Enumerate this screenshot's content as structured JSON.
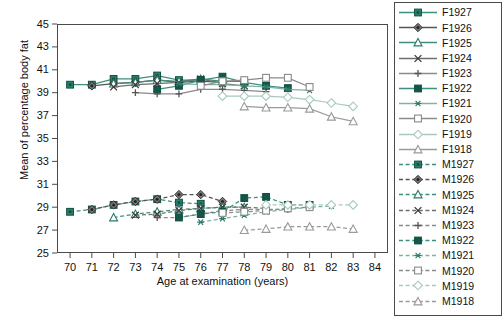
{
  "chart_data": {
    "type": "line",
    "title": "",
    "xlabel": "Age at examination (years)",
    "ylabel": "Mean of percentage body fat",
    "xlim": [
      69.4,
      84.6
    ],
    "ylim": [
      25,
      45
    ],
    "xticks": [
      70,
      71,
      72,
      73,
      74,
      75,
      76,
      77,
      78,
      79,
      80,
      81,
      82,
      83,
      84
    ],
    "yticks": [
      25,
      27,
      29,
      31,
      33,
      35,
      37,
      39,
      41,
      43,
      45
    ],
    "grid": false,
    "legend_position": "right-outside",
    "accent_color": "#2E7D6B",
    "grey_color": "#8a8a8a",
    "frame_color": "#4a4a4a",
    "series": [
      {
        "name": "F1927",
        "sex": "F",
        "cohort": 1927,
        "color": "#2E7D6B",
        "marker": "square-filled-teal",
        "dash": "solid",
        "x": [
          70,
          71,
          72,
          73,
          74,
          75,
          76
        ],
        "y": [
          39.7,
          39.7,
          40.2,
          40.2,
          40.5,
          40.1,
          40.1
        ]
      },
      {
        "name": "F1926",
        "sex": "F",
        "cohort": 1926,
        "color": "#555555",
        "marker": "diamond-filled",
        "dash": "solid",
        "x": [
          71,
          72,
          73,
          74,
          75,
          76,
          77
        ],
        "y": [
          39.6,
          39.8,
          39.9,
          40.1,
          39.9,
          40.0,
          39.9
        ]
      },
      {
        "name": "F1925",
        "sex": "F",
        "cohort": 1925,
        "color": "#2E7D6B",
        "marker": "triangle-open-teal",
        "dash": "solid",
        "x": [
          72,
          73,
          74,
          75,
          76,
          77,
          78
        ],
        "y": [
          39.8,
          39.9,
          40.1,
          40.0,
          40.2,
          40.0,
          40.0
        ]
      },
      {
        "name": "F1924",
        "sex": "F",
        "cohort": 1924,
        "color": "#6f6f6f",
        "marker": "x",
        "dash": "solid",
        "x": [
          72,
          73,
          74,
          75,
          76,
          77,
          78
        ],
        "y": [
          39.5,
          39.7,
          39.8,
          39.9,
          40.2,
          39.8,
          39.6
        ]
      },
      {
        "name": "F1923",
        "sex": "F",
        "cohort": 1923,
        "color": "#8a8a8a",
        "marker": "plus",
        "dash": "solid",
        "x": [
          73,
          74,
          75,
          76,
          77,
          78,
          79
        ],
        "y": [
          39.0,
          38.9,
          38.9,
          39.3,
          39.3,
          39.2,
          39.1
        ]
      },
      {
        "name": "F1922",
        "sex": "F",
        "cohort": 1922,
        "color": "#1f6b59",
        "marker": "square-solid-teal",
        "dash": "solid",
        "x": [
          74,
          75,
          76,
          77,
          78,
          79,
          80
        ],
        "y": [
          39.3,
          39.6,
          40.1,
          40.4,
          39.9,
          39.6,
          39.4
        ]
      },
      {
        "name": "F1921",
        "sex": "F",
        "cohort": 1921,
        "color": "#7fb3a5",
        "marker": "asterisk",
        "dash": "solid",
        "x": [
          75,
          76,
          77,
          78,
          79,
          80,
          81
        ],
        "y": [
          39.8,
          39.7,
          39.7,
          39.6,
          39.5,
          39.3,
          39.2
        ]
      },
      {
        "name": "F1920",
        "sex": "F",
        "cohort": 1920,
        "color": "#8a8a8a",
        "marker": "square-open",
        "dash": "solid",
        "x": [
          76,
          77,
          78,
          79,
          80,
          81
        ],
        "y": [
          39.6,
          40.0,
          40.1,
          40.3,
          40.3,
          39.5
        ]
      },
      {
        "name": "F1919",
        "sex": "F",
        "cohort": 1919,
        "color": "#a8c9c0",
        "marker": "diamond-open",
        "dash": "solid",
        "x": [
          77,
          78,
          79,
          80,
          81,
          82,
          83
        ],
        "y": [
          38.7,
          38.7,
          38.7,
          38.6,
          38.4,
          38.1,
          37.8
        ]
      },
      {
        "name": "F1918",
        "sex": "F",
        "cohort": 1918,
        "color": "#9a9a9a",
        "marker": "triangle-open",
        "dash": "solid",
        "x": [
          78,
          79,
          80,
          81,
          82,
          83
        ],
        "y": [
          37.8,
          37.7,
          37.7,
          37.6,
          36.9,
          36.5
        ]
      },
      {
        "name": "M1927",
        "sex": "M",
        "cohort": 1927,
        "color": "#2E7D6B",
        "marker": "square-filled-teal",
        "dash": "dashed",
        "x": [
          70,
          71,
          72,
          73,
          74,
          75,
          76
        ],
        "y": [
          28.6,
          28.8,
          29.2,
          29.5,
          29.7,
          29.4,
          29.3
        ]
      },
      {
        "name": "M1926",
        "sex": "M",
        "cohort": 1926,
        "color": "#555555",
        "marker": "diamond-filled",
        "dash": "dashed",
        "x": [
          71,
          72,
          73,
          74,
          75,
          76,
          77
        ],
        "y": [
          28.8,
          29.2,
          29.5,
          29.7,
          30.1,
          30.1,
          29.5
        ]
      },
      {
        "name": "M1925",
        "sex": "M",
        "cohort": 1925,
        "color": "#2E7D6B",
        "marker": "triangle-open-teal",
        "dash": "dashed",
        "x": [
          72,
          73,
          74,
          75,
          76,
          77,
          78
        ],
        "y": [
          28.1,
          28.4,
          28.6,
          28.8,
          28.9,
          29.0,
          29.0
        ]
      },
      {
        "name": "M1924",
        "sex": "M",
        "cohort": 1924,
        "color": "#6f6f6f",
        "marker": "x",
        "dash": "dashed",
        "x": [
          73,
          74,
          75,
          76,
          77,
          78,
          79
        ],
        "y": [
          28.3,
          28.4,
          28.7,
          28.9,
          29.0,
          29.0,
          28.9
        ]
      },
      {
        "name": "M1923",
        "sex": "M",
        "cohort": 1923,
        "color": "#8a8a8a",
        "marker": "plus",
        "dash": "dashed",
        "x": [
          74,
          75,
          76,
          77,
          78,
          79,
          80
        ],
        "y": [
          28.1,
          28.1,
          28.4,
          28.7,
          28.8,
          28.8,
          28.8
        ]
      },
      {
        "name": "M1922",
        "sex": "M",
        "cohort": 1922,
        "color": "#1f6b59",
        "marker": "square-solid-teal",
        "dash": "dashed",
        "x": [
          75,
          76,
          77,
          78,
          79,
          80,
          81
        ],
        "y": [
          28.1,
          28.4,
          28.6,
          29.8,
          29.9,
          29.2,
          29.2
        ]
      },
      {
        "name": "M1921",
        "sex": "M",
        "cohort": 1921,
        "color": "#7fb3a5",
        "marker": "asterisk",
        "dash": "dashed",
        "x": [
          76,
          77,
          78,
          79,
          80,
          81,
          82
        ],
        "y": [
          27.7,
          28.0,
          28.3,
          28.6,
          28.8,
          29.0,
          29.1
        ]
      },
      {
        "name": "M1920",
        "sex": "M",
        "cohort": 1920,
        "color": "#8a8a8a",
        "marker": "square-open",
        "dash": "dashed",
        "x": [
          77,
          78,
          79,
          80,
          81
        ],
        "y": [
          28.5,
          28.6,
          28.7,
          28.9,
          29.0
        ]
      },
      {
        "name": "M1919",
        "sex": "M",
        "cohort": 1919,
        "color": "#a8c9c0",
        "marker": "diamond-open",
        "dash": "dashed",
        "x": [
          79,
          80,
          81,
          82,
          83
        ],
        "y": [
          29.2,
          29.2,
          29.2,
          29.2,
          29.2
        ]
      },
      {
        "name": "M1918",
        "sex": "M",
        "cohort": 1918,
        "color": "#9a9a9a",
        "marker": "triangle-open",
        "dash": "dashed",
        "x": [
          78,
          79,
          80,
          81,
          82,
          83
        ],
        "y": [
          27.0,
          27.1,
          27.3,
          27.3,
          27.3,
          27.1
        ]
      }
    ],
    "legend_entries": [
      {
        "label": "F1927"
      },
      {
        "label": "F1926"
      },
      {
        "label": "F1925"
      },
      {
        "label": "F1924"
      },
      {
        "label": "F1923"
      },
      {
        "label": "F1922"
      },
      {
        "label": "F1921"
      },
      {
        "label": "F1920"
      },
      {
        "label": "F1919"
      },
      {
        "label": "F1918"
      },
      {
        "label": "M1927"
      },
      {
        "label": "M1926"
      },
      {
        "label": "M1925"
      },
      {
        "label": "M1924"
      },
      {
        "label": "M1923"
      },
      {
        "label": "M1922"
      },
      {
        "label": "M1921"
      },
      {
        "label": "M1920"
      },
      {
        "label": "M1919"
      },
      {
        "label": "M1918"
      }
    ]
  }
}
